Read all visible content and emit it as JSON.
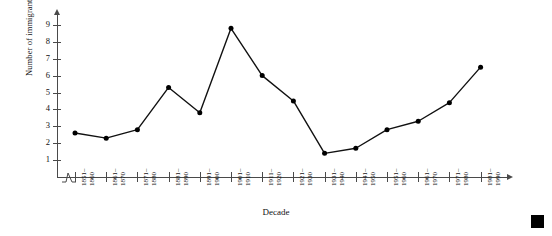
{
  "chart_data": {
    "type": "line",
    "title": "",
    "xlabel": "Decade",
    "ylabel": "Number of immigrants (in thousands)",
    "categories": [
      "1851–1860",
      "1861–1870",
      "1871–1880",
      "1881–1890",
      "1891–1900",
      "1901–1910",
      "1911–1920",
      "1921–1930",
      "1931–1940",
      "1941–1950",
      "1951–1960",
      "1961–1970",
      "1971–1980",
      "1981–1990"
    ],
    "category_lines": [
      [
        "1851–",
        "1860"
      ],
      [
        "1861–",
        "1870"
      ],
      [
        "1871–",
        "1880"
      ],
      [
        "1881–",
        "1890"
      ],
      [
        "1891–",
        "1900"
      ],
      [
        "1901–",
        "1910"
      ],
      [
        "1911–",
        "1920"
      ],
      [
        "1921–",
        "1930"
      ],
      [
        "1931–",
        "1940"
      ],
      [
        "1941–",
        "1950"
      ],
      [
        "1951–",
        "1960"
      ],
      [
        "1961–",
        "1970"
      ],
      [
        "1971–",
        "1980"
      ],
      [
        "1981–",
        "1990"
      ]
    ],
    "values": [
      2.6,
      2.3,
      2.8,
      5.3,
      3.8,
      8.8,
      6.0,
      4.5,
      1.4,
      1.7,
      2.8,
      3.3,
      4.4,
      6.5
    ],
    "ylim": [
      0,
      9.6
    ],
    "ytick_values": [
      1,
      2,
      3,
      4,
      5,
      6,
      7,
      8,
      9
    ],
    "ytick_labels": [
      "1",
      "2",
      "3",
      "4",
      "5",
      "6",
      "7",
      "8",
      "9"
    ],
    "grid": false,
    "legend": null,
    "marker": "filled-circle",
    "line_color": "#111111",
    "marker_color": "#000000",
    "axis_color": "#4a4a4a",
    "axis_break": true
  },
  "decoration": {
    "corner_square_color": "#000000"
  }
}
